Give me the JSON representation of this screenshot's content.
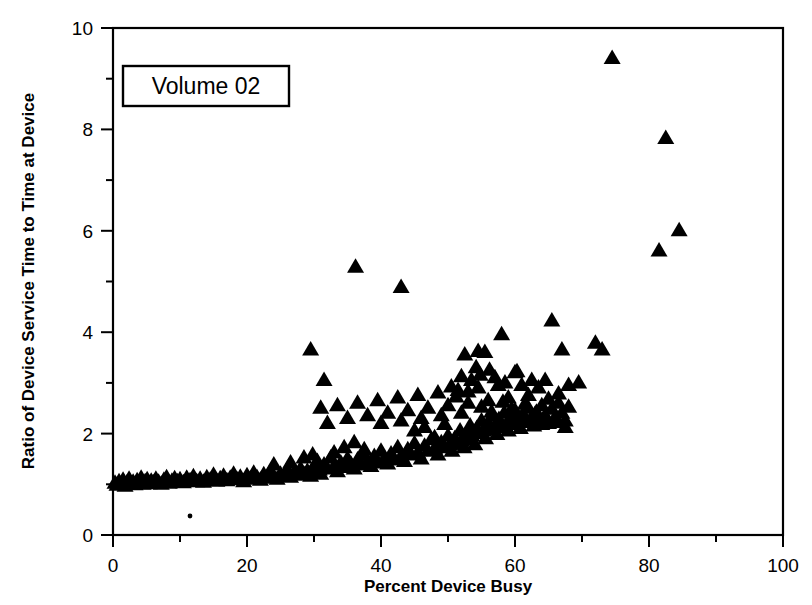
{
  "chart_data": {
    "type": "scatter",
    "title": "",
    "xlabel": "Percent Device Busy",
    "ylabel": "Ratio of Device Service Time to Time at Device",
    "xlim": [
      0,
      100
    ],
    "ylim": [
      0,
      10
    ],
    "xticks": [
      0,
      20,
      40,
      60,
      80,
      100
    ],
    "yticks": [
      0,
      2,
      4,
      6,
      8,
      10
    ],
    "xtick_labels": [
      "0",
      "20",
      "40",
      "60",
      "80",
      "100"
    ],
    "ytick_labels": [
      "0",
      "2",
      "4",
      "6",
      "8",
      "10"
    ],
    "x_minor_tick_interval": 10,
    "y_minor_tick_interval": 1,
    "grid": false,
    "legend_position": "top-left-inside",
    "marker": "triangle",
    "marker_color": "#000000",
    "annotations": [
      {
        "name": "series-label-box",
        "text": "Volume 02"
      }
    ],
    "series": [
      {
        "name": "Volume 02",
        "marker": "triangle",
        "color": "#000000",
        "points": [
          [
            0.3,
            1.02
          ],
          [
            0.6,
            0.98
          ],
          [
            0.9,
            1.05
          ],
          [
            1.2,
            1.0
          ],
          [
            1.5,
            1.08
          ],
          [
            1.8,
            0.96
          ],
          [
            2.1,
            1.03
          ],
          [
            2.4,
            1.1
          ],
          [
            2.7,
            1.0
          ],
          [
            3.0,
            1.04
          ],
          [
            3.3,
            0.99
          ],
          [
            3.6,
            1.07
          ],
          [
            3.9,
            1.02
          ],
          [
            4.2,
            1.12
          ],
          [
            4.5,
            1.0
          ],
          [
            4.8,
            1.05
          ],
          [
            5.1,
            1.09
          ],
          [
            5.4,
            1.01
          ],
          [
            5.7,
            1.06
          ],
          [
            6.0,
            1.03
          ],
          [
            6.4,
            1.1
          ],
          [
            6.8,
            1.04
          ],
          [
            7.2,
            1.0
          ],
          [
            7.6,
            1.08
          ],
          [
            8.0,
            1.13
          ],
          [
            8.4,
            1.02
          ],
          [
            8.8,
            1.06
          ],
          [
            9.2,
            1.11
          ],
          [
            9.6,
            1.05
          ],
          [
            10.0,
            1.09
          ],
          [
            10.5,
            1.03
          ],
          [
            11.0,
            1.12
          ],
          [
            11.5,
            1.07
          ],
          [
            12.0,
            1.15
          ],
          [
            12.5,
            1.05
          ],
          [
            13.0,
            1.1
          ],
          [
            13.5,
            1.04
          ],
          [
            14.0,
            1.13
          ],
          [
            14.5,
            1.08
          ],
          [
            15.0,
            1.18
          ],
          [
            15.5,
            1.06
          ],
          [
            16.0,
            1.11
          ],
          [
            16.5,
            1.16
          ],
          [
            17.0,
            1.07
          ],
          [
            17.5,
            1.12
          ],
          [
            18.0,
            1.2
          ],
          [
            18.5,
            1.09
          ],
          [
            19.0,
            1.14
          ],
          [
            19.5,
            1.05
          ],
          [
            20.0,
            1.17
          ],
          [
            20.5,
            1.1
          ],
          [
            21.0,
            1.22
          ],
          [
            21.5,
            1.13
          ],
          [
            22.0,
            1.08
          ],
          [
            22.5,
            1.19
          ],
          [
            23.0,
            1.12
          ],
          [
            23.5,
            1.25
          ],
          [
            24.0,
            1.15
          ],
          [
            24.5,
            1.1
          ],
          [
            25.0,
            1.2
          ],
          [
            25.5,
            1.16
          ],
          [
            26.0,
            1.28
          ],
          [
            26.5,
            1.14
          ],
          [
            27.0,
            1.22
          ],
          [
            27.5,
            1.18
          ],
          [
            28.0,
            1.3
          ],
          [
            28.5,
            1.2
          ],
          [
            29.0,
            1.26
          ],
          [
            29.5,
            1.16
          ],
          [
            30.0,
            1.35
          ],
          [
            30.2,
            1.22
          ],
          [
            30.5,
            1.45
          ],
          [
            30.8,
            1.28
          ],
          [
            31.0,
            1.2
          ],
          [
            31.5,
            1.38
          ],
          [
            32.0,
            1.3
          ],
          [
            32.5,
            1.52
          ],
          [
            33.0,
            1.35
          ],
          [
            33.5,
            1.25
          ],
          [
            34.0,
            1.42
          ],
          [
            34.5,
            1.33
          ],
          [
            35.0,
            1.5
          ],
          [
            35.5,
            1.4
          ],
          [
            36.0,
            1.3
          ],
          [
            36.5,
            1.48
          ],
          [
            37.0,
            1.38
          ],
          [
            37.5,
            1.58
          ],
          [
            38.0,
            1.45
          ],
          [
            38.5,
            1.35
          ],
          [
            39.0,
            1.55
          ],
          [
            39.5,
            1.42
          ],
          [
            40.0,
            1.65
          ],
          [
            40.5,
            1.5
          ],
          [
            41.0,
            1.4
          ],
          [
            41.5,
            1.6
          ],
          [
            42.0,
            1.48
          ],
          [
            42.5,
            1.72
          ],
          [
            43.0,
            1.55
          ],
          [
            43.5,
            1.45
          ],
          [
            44.0,
            1.68
          ],
          [
            44.5,
            1.58
          ],
          [
            45.0,
            1.8
          ],
          [
            45.5,
            1.62
          ],
          [
            46.0,
            1.5
          ],
          [
            46.5,
            1.75
          ],
          [
            47.0,
            1.65
          ],
          [
            47.5,
            1.88
          ],
          [
            48.0,
            1.7
          ],
          [
            48.5,
            1.58
          ],
          [
            49.0,
            1.82
          ],
          [
            49.5,
            1.72
          ],
          [
            50.0,
            1.95
          ],
          [
            50.3,
            1.78
          ],
          [
            50.6,
            1.65
          ],
          [
            51.0,
            1.9
          ],
          [
            51.4,
            1.8
          ],
          [
            51.8,
            2.05
          ],
          [
            52.0,
            1.85
          ],
          [
            52.4,
            1.72
          ],
          [
            52.8,
            2.0
          ],
          [
            53.0,
            1.88
          ],
          [
            53.3,
            2.15
          ],
          [
            53.6,
            1.95
          ],
          [
            54.0,
            1.78
          ],
          [
            54.3,
            2.1
          ],
          [
            54.6,
            2.0
          ],
          [
            55.0,
            2.25
          ],
          [
            55.3,
            2.05
          ],
          [
            55.6,
            1.9
          ],
          [
            56.0,
            2.2
          ],
          [
            56.3,
            2.08
          ],
          [
            56.6,
            2.35
          ],
          [
            57.0,
            2.15
          ],
          [
            57.3,
            1.98
          ],
          [
            57.6,
            2.28
          ],
          [
            58.0,
            2.12
          ],
          [
            58.4,
            2.4
          ],
          [
            58.8,
            2.2
          ],
          [
            59.0,
            2.05
          ],
          [
            59.4,
            2.32
          ],
          [
            59.8,
            2.18
          ],
          [
            60.0,
            2.45
          ],
          [
            60.4,
            2.25
          ],
          [
            60.8,
            2.1
          ],
          [
            61.2,
            2.38
          ],
          [
            61.6,
            2.22
          ],
          [
            62.0,
            2.5
          ],
          [
            62.4,
            2.3
          ],
          [
            62.8,
            2.15
          ],
          [
            63.2,
            2.42
          ],
          [
            63.6,
            2.28
          ],
          [
            64.0,
            2.55
          ],
          [
            64.5,
            2.35
          ],
          [
            65.0,
            2.2
          ],
          [
            65.5,
            2.48
          ],
          [
            66.0,
            2.32
          ],
          [
            66.5,
            2.6
          ],
          [
            67.0,
            2.4
          ],
          [
            67.5,
            2.25
          ],
          [
            68.0,
            2.52
          ],
          [
            31.0,
            2.5
          ],
          [
            32.0,
            2.2
          ],
          [
            33.5,
            2.55
          ],
          [
            35.0,
            2.3
          ],
          [
            36.5,
            2.6
          ],
          [
            38.0,
            2.35
          ],
          [
            39.5,
            2.65
          ],
          [
            41.0,
            2.4
          ],
          [
            42.5,
            2.7
          ],
          [
            44.0,
            2.45
          ],
          [
            45.5,
            2.75
          ],
          [
            47.0,
            2.5
          ],
          [
            48.5,
            2.8
          ],
          [
            50.0,
            2.55
          ],
          [
            51.5,
            2.85
          ],
          [
            53.0,
            2.6
          ],
          [
            54.5,
            2.9
          ],
          [
            56.0,
            2.65
          ],
          [
            57.5,
            2.95
          ],
          [
            59.0,
            2.7
          ],
          [
            40.0,
            2.2
          ],
          [
            43.0,
            2.25
          ],
          [
            46.0,
            2.3
          ],
          [
            49.0,
            2.35
          ],
          [
            52.0,
            2.4
          ],
          [
            53.5,
            3.05
          ],
          [
            54.2,
            3.3
          ],
          [
            54.8,
            3.15
          ],
          [
            55.5,
            3.6
          ],
          [
            56.2,
            3.25
          ],
          [
            57.0,
            3.1
          ],
          [
            58.5,
            3.0
          ],
          [
            60.0,
            3.2
          ],
          [
            61.0,
            2.95
          ],
          [
            62.5,
            3.05
          ],
          [
            29.5,
            3.65
          ],
          [
            31.5,
            3.05
          ],
          [
            36.2,
            5.28
          ],
          [
            43.0,
            4.88
          ],
          [
            52.5,
            3.55
          ],
          [
            54.5,
            3.62
          ],
          [
            58.0,
            3.95
          ],
          [
            60.3,
            3.22
          ],
          [
            62.0,
            2.75
          ],
          [
            63.5,
            2.9
          ],
          [
            64.5,
            3.05
          ],
          [
            65.5,
            4.22
          ],
          [
            66.5,
            2.78
          ],
          [
            67.0,
            3.65
          ],
          [
            68.0,
            2.95
          ],
          [
            69.5,
            3.0
          ],
          [
            72.0,
            3.78
          ],
          [
            73.0,
            3.65
          ],
          [
            74.5,
            9.4
          ],
          [
            81.5,
            5.6
          ],
          [
            82.5,
            7.82
          ],
          [
            84.5,
            6.0
          ],
          [
            50.5,
            2.92
          ],
          [
            51.2,
            2.72
          ],
          [
            52.0,
            3.12
          ],
          [
            53.0,
            2.82
          ],
          [
            55.0,
            2.52
          ],
          [
            56.5,
            2.42
          ],
          [
            57.5,
            2.22
          ],
          [
            58.2,
            2.62
          ],
          [
            59.5,
            2.48
          ],
          [
            60.5,
            2.28
          ],
          [
            61.5,
            2.58
          ],
          [
            63.0,
            2.38
          ],
          [
            64.0,
            2.18
          ],
          [
            65.0,
            2.68
          ],
          [
            66.0,
            2.22
          ],
          [
            67.5,
            2.12
          ],
          [
            45.0,
            2.05
          ],
          [
            46.5,
            2.12
          ],
          [
            48.0,
            1.92
          ],
          [
            49.5,
            2.18
          ],
          [
            33.0,
            1.62
          ],
          [
            34.5,
            1.72
          ],
          [
            36.0,
            1.82
          ],
          [
            37.5,
            1.68
          ],
          [
            28.5,
            1.52
          ],
          [
            29.8,
            1.58
          ],
          [
            26.5,
            1.42
          ],
          [
            24.0,
            1.38
          ]
        ]
      }
    ]
  },
  "figure": {
    "background": "#ffffff",
    "axis_color": "#000000"
  }
}
